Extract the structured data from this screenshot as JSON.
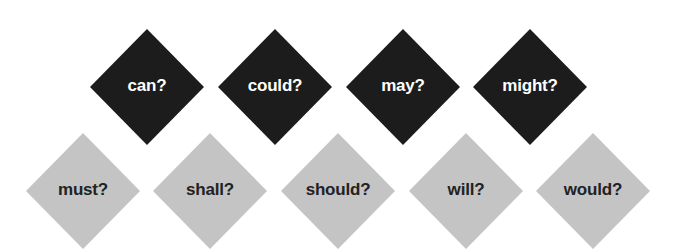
{
  "colors": {
    "dark_fill": "#1c1c1c",
    "light_fill": "#c4c4c4",
    "dark_text": "#ffffff",
    "light_text": "#222222"
  },
  "top_row": [
    {
      "label": "can?",
      "cx": 147,
      "cy": 87
    },
    {
      "label": "could?",
      "cx": 275,
      "cy": 87
    },
    {
      "label": "may?",
      "cx": 403,
      "cy": 87
    },
    {
      "label": "might?",
      "cx": 530,
      "cy": 87
    }
  ],
  "bottom_row": [
    {
      "label": "must?",
      "cx": 83,
      "cy": 191
    },
    {
      "label": "shall?",
      "cx": 210,
      "cy": 191
    },
    {
      "label": "should?",
      "cx": 338,
      "cy": 191
    },
    {
      "label": "will?",
      "cx": 466,
      "cy": 191
    },
    {
      "label": "would?",
      "cx": 593,
      "cy": 191
    }
  ]
}
